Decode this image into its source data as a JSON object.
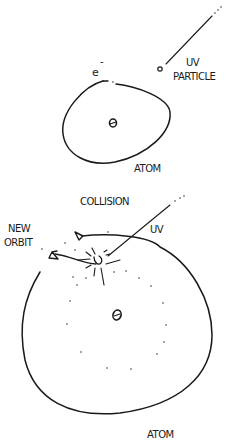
{
  "colors": {
    "ink": "#1a1a1a",
    "background": "#ffffff"
  },
  "panel_top": {
    "electron_label": "e",
    "electron_charge": "-",
    "uv_label_line1": "UV",
    "uv_label_line2": "PARTICLE",
    "atom_label": "ATOM"
  },
  "panel_bottom": {
    "collision_label": "COLLISION",
    "uv_label": "UV",
    "new_orbit_line1": "NEW",
    "new_orbit_line2": "ORBIT",
    "atom_label": "ATOM"
  }
}
